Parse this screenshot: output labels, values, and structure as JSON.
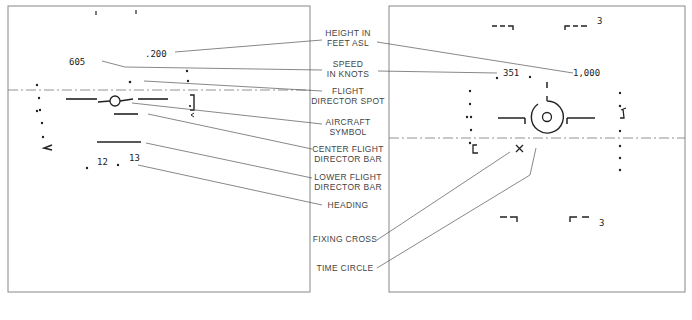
{
  "left_display": {
    "height_value": ".200",
    "speed_value": "605",
    "heading_values": [
      "12",
      "13"
    ]
  },
  "right_display": {
    "height_value": "1,000",
    "heading_value": "351",
    "bracket_top_right_label": "3",
    "bracket_bottom_right_label": "3"
  },
  "callouts": {
    "height": [
      "HEIGHT IN",
      "FEET ASL"
    ],
    "speed": [
      "SPEED",
      "IN KNOTS"
    ],
    "fd_spot": [
      "FLIGHT",
      "DIRECTOR SPOT"
    ],
    "aircraft": [
      "AIRCRAFT",
      "SYMBOL"
    ],
    "center_bar": [
      "CENTER FLIGHT",
      "DIRECTOR BAR"
    ],
    "lower_bar": [
      "LOWER FLIGHT",
      "DIRECTOR BAR"
    ],
    "heading": [
      "HEADING"
    ],
    "fixing_cross": [
      "FIXING CROSS"
    ],
    "time_circle": [
      "TIME CIRCLE"
    ]
  }
}
